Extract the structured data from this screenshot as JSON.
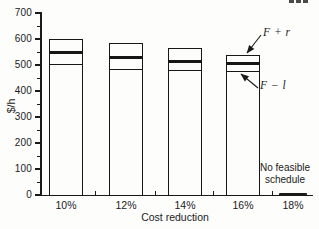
{
  "page": {
    "background": "#fdfdfb",
    "ink": "#1b1b1b",
    "corner_fragment": "...",
    "corner_fragment_desc": "bottom edge of cropped page-number text"
  },
  "chart_data": {
    "type": "bar",
    "title": "",
    "xlabel": "Cost reduction",
    "ylabel": "$/h",
    "ylim": [
      0,
      700
    ],
    "yticks": [
      700,
      600,
      500,
      400,
      300,
      200,
      100,
      0
    ],
    "minor_ytick_interval": 50,
    "grid": false,
    "legend": "none",
    "categories": [
      "10%",
      "12%",
      "14%",
      "16%",
      "18%"
    ],
    "series": [
      {
        "name": "F + r (bar top)",
        "values": [
          600,
          585,
          565,
          540,
          null
        ]
      },
      {
        "name": "F (thick mid line)",
        "values": [
          545,
          528,
          512,
          502,
          null
        ]
      },
      {
        "name": "F − l (thin lower line)",
        "values": [
          500,
          480,
          476,
          474,
          null
        ]
      }
    ],
    "annotations": [
      {
        "label": "F + r",
        "points_to": "top of 16% bar"
      },
      {
        "label": "F − l",
        "points_to": "lower thin line of 16% bar"
      }
    ],
    "note": {
      "line1": "No feasible",
      "line2": "schedule",
      "category": "18%"
    }
  }
}
